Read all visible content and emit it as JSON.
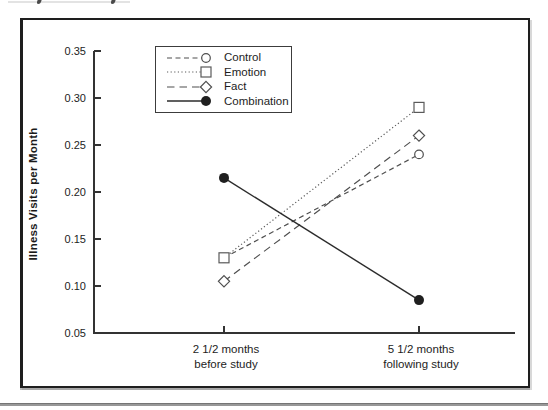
{
  "figure": {
    "ylabel": "Illness Visits per Month",
    "background": "#ffffff",
    "frame_color": "#1e1e1e",
    "axis_color": "#333333",
    "text_color": "#1d1d1d",
    "bottom_rule_color": "#989898"
  },
  "chart_data": {
    "type": "line",
    "title": "",
    "xlabel": "",
    "ylabel": "Illness Visits per Month",
    "categories": [
      "2 1/2 months\nbefore study",
      "5 1/2 months\nfollowing study"
    ],
    "ylim": [
      0.05,
      0.35
    ],
    "yticks": [
      0.05,
      0.1,
      0.15,
      0.2,
      0.25,
      0.3,
      0.35
    ],
    "grid": false,
    "legend_position": "upper-left-inside",
    "series": [
      {
        "name": "Control",
        "values": [
          0.13,
          0.24
        ],
        "line": "dashed",
        "marker": "open-circle",
        "color": "#4f4f4f"
      },
      {
        "name": "Emotion",
        "values": [
          0.13,
          0.29
        ],
        "line": "dotted",
        "marker": "open-square",
        "color": "#5a5a5a"
      },
      {
        "name": "Fact",
        "values": [
          0.105,
          0.26
        ],
        "line": "long-dashed",
        "marker": "open-diamond",
        "color": "#4f4f4f"
      },
      {
        "name": "Combination",
        "values": [
          0.215,
          0.085
        ],
        "line": "solid",
        "marker": "filled-circle",
        "color": "#2b2b2b"
      }
    ]
  }
}
